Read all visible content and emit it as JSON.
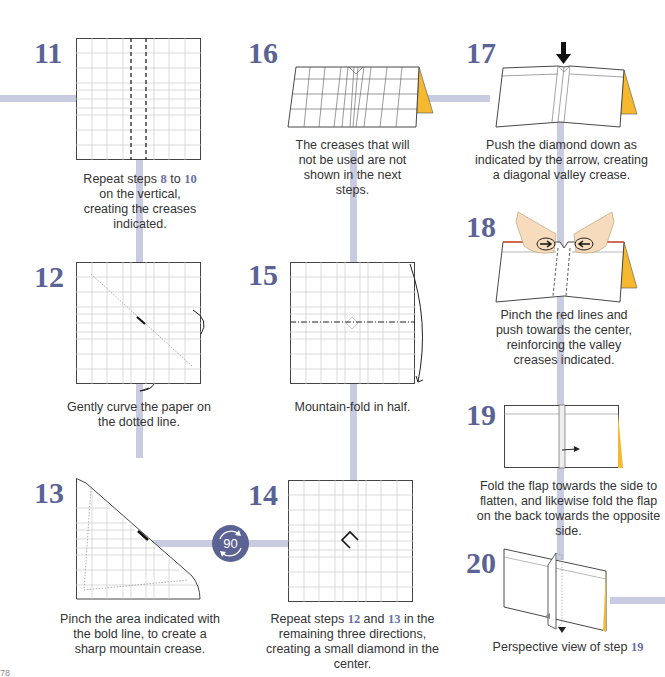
{
  "page": {
    "number": "78"
  },
  "colors": {
    "step_number": "#5a6394",
    "connector": "#c9cbe0",
    "paper_back": "#f5b82e",
    "badge": "#5a6394",
    "pinch_red": "#e0553a"
  },
  "steps": [
    {
      "number": "11",
      "caption_parts": [
        "Repeat steps ",
        "8",
        " to ",
        "10",
        " on the vertical, creating the creases indicated."
      ]
    },
    {
      "number": "12",
      "caption": "Gently curve the paper on the dotted line."
    },
    {
      "number": "13",
      "caption": "Pinch the area indicated with the bold line, to create a sharp mountain crease."
    },
    {
      "number": "14",
      "caption_parts": [
        "Repeat steps ",
        "12",
        " and ",
        "13",
        " in the remaining three directions, creating a small diamond in the center."
      ]
    },
    {
      "number": "15",
      "caption": "Mountain-fold in half."
    },
    {
      "number": "16",
      "caption": "The creases that will not be used are not shown in the next steps."
    },
    {
      "number": "17",
      "caption": "Push the diamond down as indicated by the arrow, creating a diagonal valley crease."
    },
    {
      "number": "18",
      "caption": "Pinch the red lines and push towards the center, reinforcing the valley creases indicated."
    },
    {
      "number": "19",
      "caption": "Fold the flap towards the side to flatten, and likewise fold the flap on the back towards the opposite side."
    },
    {
      "number": "20",
      "caption_parts": [
        "Perspective view of step ",
        "19"
      ]
    }
  ],
  "rotate_badge": {
    "label": "90",
    "icon": "rotate-90-icon"
  }
}
